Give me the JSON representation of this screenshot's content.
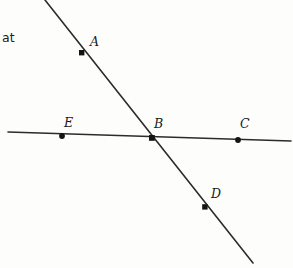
{
  "figure": {
    "type": "geometry-diagram",
    "width": 293,
    "height": 268,
    "background_color": "#fdfdfc",
    "stroke_color": "#2b2b2b",
    "label_color": "#1a1a1a"
  },
  "cropped_text": {
    "value": "at",
    "x": 2,
    "y": 32
  },
  "lines": [
    {
      "name": "horizontal-line",
      "x1": 8,
      "y1": 132,
      "x2": 291,
      "y2": 141,
      "stroke_width": 1.6
    },
    {
      "name": "diagonal-line",
      "x1": 45,
      "y1": 0,
      "x2": 253,
      "y2": 263,
      "stroke_width": 1.6
    }
  ],
  "points": [
    {
      "id": "A",
      "label": "A",
      "x": 82,
      "y": 53,
      "label_x": 90,
      "label_y": 36,
      "on_line": "diagonal-line"
    },
    {
      "id": "B",
      "label": "B",
      "x": 152,
      "y": 138,
      "label_x": 154,
      "label_y": 118,
      "on_line": "intersection"
    },
    {
      "id": "C",
      "label": "C",
      "x": 238,
      "y": 140,
      "label_x": 240,
      "label_y": 118,
      "on_line": "horizontal-line"
    },
    {
      "id": "D",
      "label": "D",
      "x": 205,
      "y": 207,
      "label_x": 211,
      "label_y": 188,
      "on_line": "diagonal-line"
    },
    {
      "id": "E",
      "label": "E",
      "x": 62,
      "y": 136,
      "label_x": 64,
      "label_y": 117,
      "on_line": "horizontal-line"
    }
  ]
}
